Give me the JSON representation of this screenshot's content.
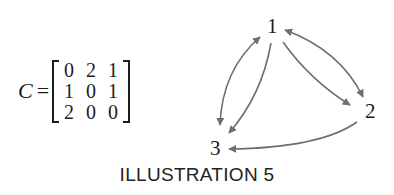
{
  "equation": {
    "label": "C",
    "sign": "=",
    "matrix": [
      [
        "0",
        "2",
        "1"
      ],
      [
        "1",
        "0",
        "1"
      ],
      [
        "2",
        "0",
        "0"
      ]
    ]
  },
  "graph": {
    "nodes": [
      {
        "id": "1",
        "label": "1"
      },
      {
        "id": "2",
        "label": "2"
      },
      {
        "id": "3",
        "label": "3"
      }
    ],
    "edges": [
      {
        "from": "1",
        "to": "2",
        "type": "bidirectional-outer"
      },
      {
        "from": "1",
        "to": "2",
        "type": "directed-inner"
      },
      {
        "from": "3",
        "to": "1",
        "type": "bidirectional-outer"
      },
      {
        "from": "1",
        "to": "3",
        "type": "directed-inner"
      },
      {
        "from": "2",
        "to": "3",
        "type": "directed"
      }
    ],
    "edge_color": "#6e6e6e"
  },
  "caption": "ILLUSTRATION 5"
}
